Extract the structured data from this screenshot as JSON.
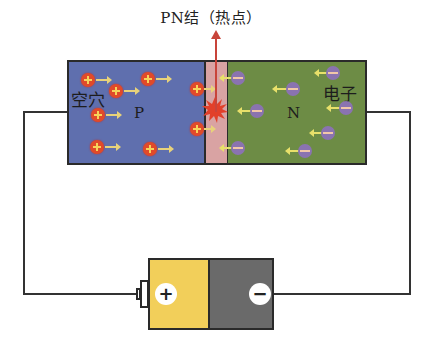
{
  "title": "PN结（热点）",
  "diode": {
    "p_region": {
      "label": "P",
      "carrier_label": "空穴",
      "color": "#5f6fae",
      "carrier": "hole (+)",
      "carrier_direction": "right"
    },
    "junction": {
      "color": "#d9a3a3",
      "hotspot_color": "#e2402a"
    },
    "n_region": {
      "label": "N",
      "carrier_label": "电子",
      "color": "#6d8c45",
      "carrier": "electron (−)",
      "carrier_direction": "left"
    }
  },
  "battery": {
    "positive_symbol": "+",
    "negative_symbol": "−",
    "positive_color": "#f2cf5a",
    "negative_color": "#6a6a6a"
  },
  "arrow_color": "#c8443a"
}
